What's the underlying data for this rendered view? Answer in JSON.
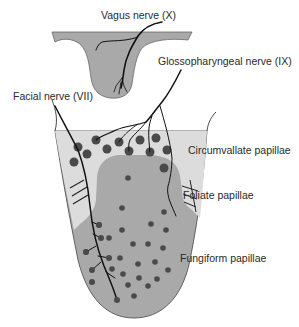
{
  "labels": {
    "vagus": "Vagus nerve (X)",
    "glossopharyngeal": "Glossopharyngeal nerve (IX)",
    "facial": "Facial nerve (VII)",
    "circumvallate": "Circumvallate papillae",
    "foliate": "Foliate papillae",
    "fungiform": "Fungiform papillae"
  },
  "colors": {
    "tissue_dark": "#a9a9a9",
    "tissue_light": "#dcdcdc",
    "papilla": "#4a4a4a",
    "nerve": "#111111",
    "outline": "#555555"
  },
  "regions": [
    {
      "name": "pharynx",
      "innervation": "Vagus nerve (X)"
    },
    {
      "name": "posterior tongue",
      "innervation": "Glossopharyngeal nerve (IX)",
      "papillae": [
        "Circumvallate papillae",
        "Foliate papillae"
      ]
    },
    {
      "name": "anterior tongue",
      "innervation": "Facial nerve (VII)",
      "papillae": [
        "Fungiform papillae"
      ]
    }
  ]
}
